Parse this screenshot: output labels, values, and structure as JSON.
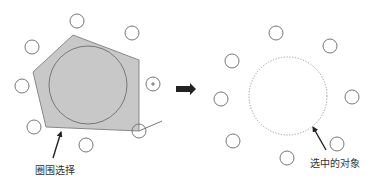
{
  "diagram": {
    "type": "before-after selection illustration",
    "colors": {
      "stroke": "#777777",
      "polygon_fill": "#c8c8c8",
      "polygon_stroke": "#888888",
      "arrow": "#222222",
      "dotted": "#999999",
      "background": "#ffffff"
    },
    "left_panel": {
      "label": "圈围选择",
      "label_pos": {
        "x": 35,
        "y": 165
      },
      "lasso_polygon": [
        [
          73,
          35
        ],
        [
          139,
          60
        ],
        [
          139,
          131
        ],
        [
          46,
          127
        ],
        [
          33,
          72
        ]
      ],
      "big_circle": {
        "cx": 88,
        "cy": 85,
        "r": 39
      },
      "small_circles": [
        {
          "cx": 77,
          "cy": 21,
          "r": 7
        },
        {
          "cx": 132,
          "cy": 33,
          "r": 7
        },
        {
          "cx": 32,
          "cy": 47,
          "r": 7
        },
        {
          "cx": 22,
          "cy": 86,
          "r": 7
        },
        {
          "cx": 34,
          "cy": 127,
          "r": 7
        },
        {
          "cx": 86,
          "cy": 145,
          "r": 7
        },
        {
          "cx": 153,
          "cy": 84,
          "r": 7,
          "cross": true
        },
        {
          "cx": 139,
          "cy": 131,
          "r": 7
        }
      ],
      "cursor_line": {
        "x1": 139,
        "y1": 131,
        "x2": 162,
        "y2": 121
      },
      "pointer_arrow": {
        "x1": 53,
        "y1": 158,
        "x2": 61,
        "y2": 132
      }
    },
    "transition_arrow": {
      "x1": 176,
      "x2": 196,
      "y": 89
    },
    "right_panel": {
      "label": "选中的对象",
      "label_pos": {
        "x": 310,
        "y": 158
      },
      "selected_circle": {
        "cx": 288,
        "cy": 96,
        "r": 39,
        "style": "dotted"
      },
      "small_circles": [
        {
          "cx": 276,
          "cy": 33,
          "r": 7
        },
        {
          "cx": 330,
          "cy": 46,
          "r": 7
        },
        {
          "cx": 232,
          "cy": 61,
          "r": 7
        },
        {
          "cx": 221,
          "cy": 99,
          "r": 7
        },
        {
          "cx": 352,
          "cy": 97,
          "r": 7
        },
        {
          "cx": 233,
          "cy": 141,
          "r": 7
        },
        {
          "cx": 337,
          "cy": 144,
          "r": 7
        },
        {
          "cx": 287,
          "cy": 158,
          "r": 7
        }
      ],
      "pointer_arrow": {
        "x1": 326,
        "y1": 150,
        "x2": 313,
        "y2": 127
      }
    }
  }
}
